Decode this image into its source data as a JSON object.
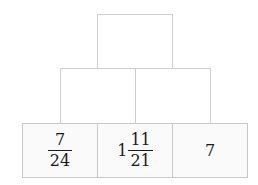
{
  "pyramid": {
    "rows": [
      {
        "cells": [
          {
            "value": ""
          }
        ]
      },
      {
        "cells": [
          {
            "value": ""
          },
          {
            "value": ""
          }
        ]
      },
      {
        "cells": [
          {
            "type": "fraction",
            "numerator": "7",
            "denominator": "24"
          },
          {
            "type": "mixed",
            "whole": "1",
            "numerator": "11",
            "denominator": "21"
          },
          {
            "type": "integer",
            "value": "7"
          }
        ]
      }
    ]
  },
  "colors": {
    "border": "#cfcfcf",
    "bottom_fill": "#fafafa",
    "text": "#1a1a1a"
  }
}
